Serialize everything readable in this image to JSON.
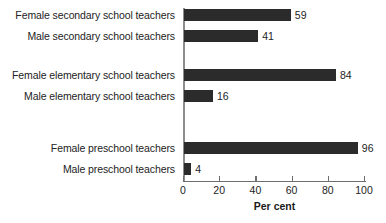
{
  "chart_data": {
    "type": "bar",
    "orientation": "horizontal",
    "title": "",
    "xlabel": "Per cent",
    "ylabel": "",
    "xlim": [
      0,
      100
    ],
    "xticks": [
      0,
      20,
      40,
      60,
      80,
      100
    ],
    "xtick_labels": [
      "0",
      "20",
      "40",
      "60",
      "80",
      "100"
    ],
    "grid": false,
    "legend": "none",
    "bar_color": "#2b2b2b",
    "background_color": "#ffffff",
    "categories": [
      "Female secondary school teachers",
      "Male secondary school teachers",
      "Female elementary school teachers",
      "Male elementary school teachers",
      "Female preschool teachers",
      "Male preschool teachers"
    ],
    "values": [
      59,
      41,
      84,
      16,
      96,
      4
    ],
    "data_labels": [
      "59",
      "41",
      "84",
      "16",
      "96",
      "4"
    ],
    "groups": [
      {
        "name": "secondary school teachers",
        "female": 59,
        "male": 41
      },
      {
        "name": "elementary school teachers",
        "female": 84,
        "male": 16
      },
      {
        "name": "preschool teachers",
        "female": 96,
        "male": 4
      }
    ]
  },
  "axis": {
    "x_title": "Per cent"
  }
}
